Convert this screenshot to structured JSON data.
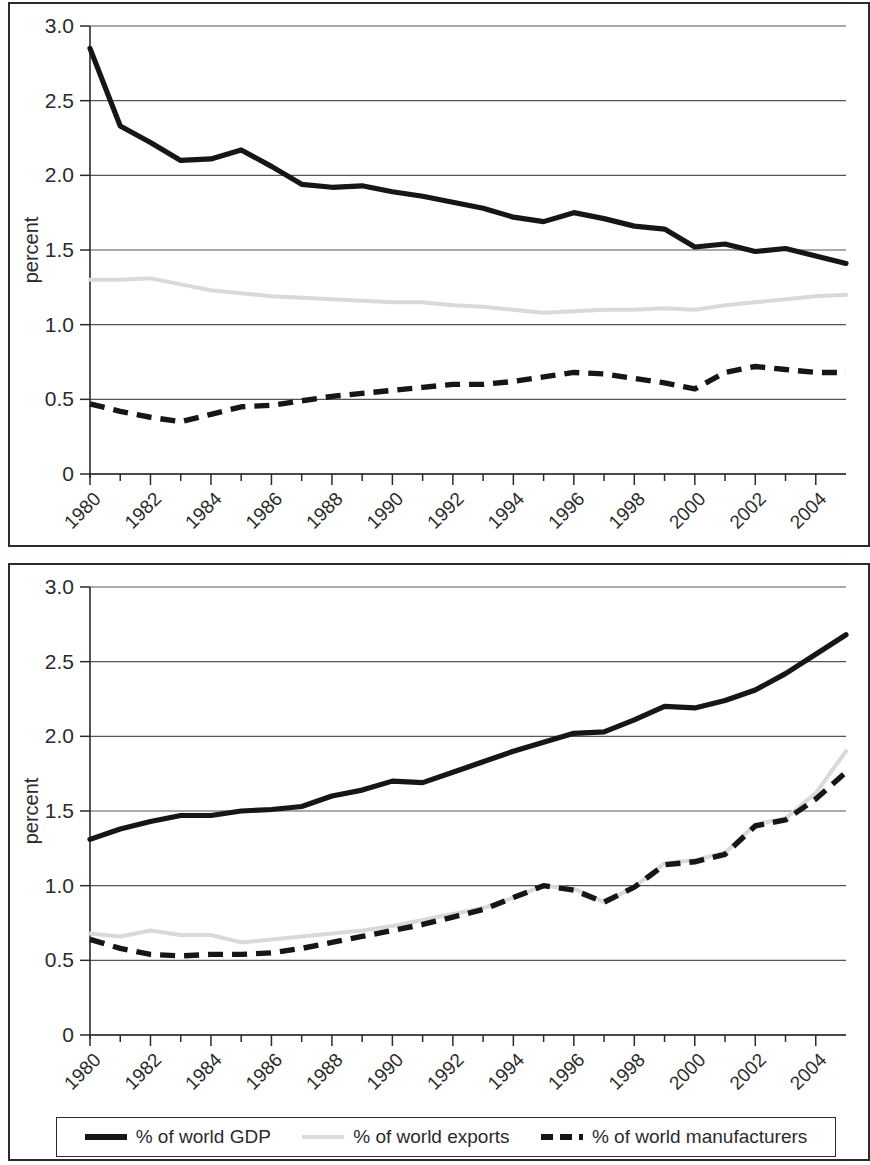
{
  "figure": {
    "y_axis_label": "percent",
    "y_ticks": [
      "3.0",
      "2.5",
      "2.0",
      "1.5",
      "1.0",
      "0.5",
      "0"
    ],
    "x_ticks": [
      "1980",
      "1982",
      "1984",
      "1986",
      "1988",
      "1990",
      "1992",
      "1994",
      "1996",
      "1998",
      "2000",
      "2002",
      "2004"
    ],
    "colors": {
      "gdp": "#161616",
      "exports": "#d9d9d9",
      "manufacturers": "#161616",
      "gridline": "#55555a",
      "axis": "#2b2b2b"
    }
  },
  "legend": {
    "items": [
      {
        "label": "% of world GDP",
        "style": "solid",
        "swatch": "swatch-solid"
      },
      {
        "label": "% of world exports",
        "style": "light-solid",
        "swatch": "swatch-light"
      },
      {
        "label": "% of world manufacturers",
        "style": "dashed",
        "swatch": "swatch-dashed"
      }
    ]
  },
  "chart_data": [
    {
      "type": "line",
      "title": "",
      "panel": "top",
      "xlabel": "",
      "ylabel": "percent",
      "xlim": [
        1980,
        2005
      ],
      "ylim": [
        0,
        3.0
      ],
      "grid": true,
      "legend_position": "below-figure",
      "x": [
        1980,
        1981,
        1982,
        1983,
        1984,
        1985,
        1986,
        1987,
        1988,
        1989,
        1990,
        1991,
        1992,
        1993,
        1994,
        1995,
        1996,
        1997,
        1998,
        1999,
        2000,
        2001,
        2002,
        2003,
        2004,
        2005
      ],
      "tick_values": [
        1980,
        1982,
        1984,
        1986,
        1988,
        1990,
        1992,
        1994,
        1996,
        1998,
        2000,
        2002,
        2004
      ],
      "series": [
        {
          "name": "% of world GDP",
          "values": [
            2.85,
            2.33,
            2.22,
            2.1,
            2.11,
            2.17,
            2.06,
            1.94,
            1.92,
            1.93,
            1.89,
            1.86,
            1.82,
            1.78,
            1.72,
            1.69,
            1.75,
            1.71,
            1.66,
            1.64,
            1.52,
            1.54,
            1.49,
            1.51,
            1.46,
            1.41
          ]
        },
        {
          "name": "% of world exports",
          "values": [
            1.3,
            1.3,
            1.31,
            1.27,
            1.23,
            1.21,
            1.19,
            1.18,
            1.17,
            1.16,
            1.15,
            1.15,
            1.13,
            1.12,
            1.1,
            1.08,
            1.09,
            1.1,
            1.1,
            1.11,
            1.1,
            1.13,
            1.15,
            1.17,
            1.19,
            1.2
          ]
        },
        {
          "name": "% of world manufacturers",
          "values": [
            0.47,
            0.42,
            0.38,
            0.35,
            0.4,
            0.45,
            0.46,
            0.49,
            0.52,
            0.54,
            0.56,
            0.58,
            0.6,
            0.6,
            0.62,
            0.65,
            0.68,
            0.67,
            0.64,
            0.61,
            0.57,
            0.68,
            0.72,
            0.7,
            0.68,
            0.68
          ]
        }
      ]
    },
    {
      "type": "line",
      "title": "",
      "panel": "bottom",
      "xlabel": "",
      "ylabel": "percent",
      "xlim": [
        1980,
        2005
      ],
      "ylim": [
        0,
        3.0
      ],
      "grid": true,
      "legend_position": "below-figure",
      "x": [
        1980,
        1981,
        1982,
        1983,
        1984,
        1985,
        1986,
        1987,
        1988,
        1989,
        1990,
        1991,
        1992,
        1993,
        1994,
        1995,
        1996,
        1997,
        1998,
        1999,
        2000,
        2001,
        2002,
        2003,
        2004,
        2005
      ],
      "tick_values": [
        1980,
        1982,
        1984,
        1986,
        1988,
        1990,
        1992,
        1994,
        1996,
        1998,
        2000,
        2002,
        2004
      ],
      "series": [
        {
          "name": "% of world GDP",
          "values": [
            1.31,
            1.38,
            1.43,
            1.47,
            1.47,
            1.5,
            1.51,
            1.53,
            1.6,
            1.64,
            1.7,
            1.69,
            1.76,
            1.83,
            1.9,
            1.96,
            2.02,
            2.03,
            2.11,
            2.2,
            2.19,
            2.24,
            2.31,
            2.42,
            2.55,
            2.68
          ]
        },
        {
          "name": "% of world exports",
          "values": [
            0.68,
            0.66,
            0.7,
            0.67,
            0.67,
            0.62,
            0.64,
            0.66,
            0.68,
            0.7,
            0.73,
            0.77,
            0.81,
            0.85,
            0.92,
            1.0,
            0.98,
            0.89,
            0.99,
            1.15,
            1.17,
            1.22,
            1.41,
            1.45,
            1.62,
            1.9
          ]
        },
        {
          "name": "% of world manufacturers",
          "values": [
            0.64,
            0.58,
            0.54,
            0.53,
            0.54,
            0.54,
            0.55,
            0.58,
            0.62,
            0.66,
            0.7,
            0.74,
            0.79,
            0.84,
            0.92,
            1.0,
            0.97,
            0.89,
            0.99,
            1.14,
            1.16,
            1.21,
            1.4,
            1.44,
            1.58,
            1.76
          ]
        }
      ]
    }
  ]
}
